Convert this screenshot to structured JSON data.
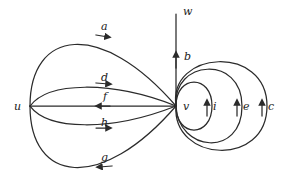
{
  "figure": {
    "kind": "directed-multigraph-diagram",
    "background_color": "#ffffff",
    "stroke_color": "#2b2b2b",
    "label_color": "#1a1a1a"
  },
  "vertices": [
    {
      "id": "u",
      "label": "u",
      "x": 30,
      "y": 106,
      "label_x": 14,
      "label_y": 101
    },
    {
      "id": "v",
      "label": "v",
      "x": 176,
      "y": 106,
      "label_x": 183,
      "label_y": 101
    },
    {
      "id": "w",
      "label": "w",
      "x": 176,
      "y": 12,
      "label_x": 183,
      "label_y": 6
    }
  ],
  "edges": [
    {
      "id": "a",
      "label": "a",
      "from": "u",
      "to": "v",
      "direction": "right",
      "label_x": 101,
      "label_y": 21
    },
    {
      "id": "d",
      "label": "d",
      "from": "u",
      "to": "v",
      "direction": "right",
      "label_x": 101,
      "label_y": 72
    },
    {
      "id": "f",
      "label": "f",
      "from": "v",
      "to": "u",
      "direction": "left",
      "label_x": 103,
      "label_y": 91
    },
    {
      "id": "h",
      "label": "h",
      "from": "u",
      "to": "v",
      "direction": "right",
      "label_x": 101,
      "label_y": 117
    },
    {
      "id": "g",
      "label": "g",
      "from": "v",
      "to": "u",
      "direction": "left",
      "label_x": 101,
      "label_y": 152
    },
    {
      "id": "b",
      "label": "b",
      "from": "v",
      "to": "w",
      "direction": "up",
      "label_x": 184,
      "label_y": 51
    },
    {
      "id": "i",
      "label": "i",
      "from": "v",
      "to": "v",
      "direction": "up",
      "label_x": 213,
      "label_y": 101
    },
    {
      "id": "e",
      "label": "e",
      "from": "v",
      "to": "v",
      "direction": "up",
      "label_x": 243,
      "label_y": 101
    },
    {
      "id": "c",
      "label": "c",
      "from": "v",
      "to": "v",
      "direction": "up",
      "label_x": 268,
      "label_y": 101
    }
  ]
}
